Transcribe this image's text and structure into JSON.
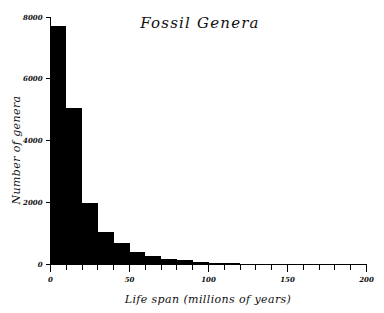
{
  "chart_data": {
    "type": "bar",
    "title": "Fossil Genera",
    "xlabel": "Life span (millions of years)",
    "ylabel": "Number of genera",
    "xlim": [
      0,
      200
    ],
    "ylim": [
      0,
      8000
    ],
    "grid": false,
    "legend": null,
    "bin_width": 10,
    "xticks_major": [
      0,
      50,
      100,
      150,
      200
    ],
    "xtick_labels": [
      "0",
      "50",
      "100",
      "150",
      "200"
    ],
    "xticks_minor_step": 10,
    "yticks_major": [
      0,
      2000,
      4000,
      6000,
      8000
    ],
    "ytick_labels": [
      "0",
      "2000",
      "4000",
      "6000",
      "8000"
    ],
    "bar_color": "#000000",
    "categories": [
      "0-10",
      "10-20",
      "20-30",
      "30-40",
      "40-50",
      "50-60",
      "60-70",
      "70-80",
      "80-90",
      "90-100",
      "100-110",
      "110-120",
      "120-130",
      "130-140",
      "140-150",
      "150-160",
      "160-170",
      "170-180",
      "180-190",
      "190-200"
    ],
    "x": [
      0,
      10,
      20,
      30,
      40,
      50,
      60,
      70,
      80,
      90,
      100,
      110,
      120,
      130,
      140,
      150,
      160,
      170,
      180,
      190
    ],
    "values": [
      7700,
      5050,
      1980,
      1040,
      680,
      400,
      290,
      180,
      130,
      95,
      60,
      45,
      10,
      25,
      0,
      0,
      0,
      0,
      0,
      0
    ]
  }
}
